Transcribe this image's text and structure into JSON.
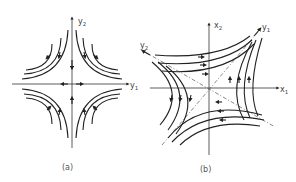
{
  "panels": [
    {
      "id": "a",
      "caption": "(a)",
      "axes": {
        "horizontal": {
          "label": "y",
          "subscript": "1"
        },
        "vertical": {
          "label": "y",
          "subscript": "2"
        }
      },
      "description": "Saddle point phase portrait in eigen-coordinates; trajectories are hyperbolas approaching along y2 axis and leaving along y1 axis"
    },
    {
      "id": "b",
      "caption": "(b)",
      "axes": {
        "horizontal": {
          "label": "x",
          "subscript": "1"
        },
        "vertical": {
          "label": "x",
          "subscript": "2"
        },
        "eigen1": {
          "label": "y",
          "subscript": "1"
        },
        "eigen2": {
          "label": "y",
          "subscript": "2"
        }
      },
      "description": "Same saddle point in original x-coordinates with rotated eigen-axes y1 and y2 shown dashed"
    }
  ],
  "colors": {
    "line": "#222222",
    "background": "#ffffff"
  }
}
